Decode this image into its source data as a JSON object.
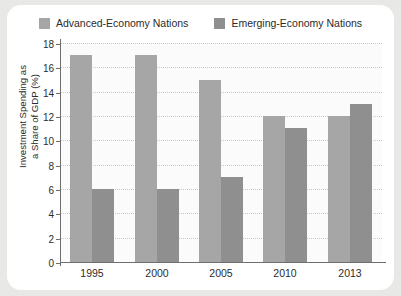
{
  "chart_data": {
    "type": "bar",
    "title": "",
    "xlabel": "",
    "ylabel_line1": "Investment Spending as",
    "ylabel_line2": "a Share of GDP (%)",
    "categories": [
      "1995",
      "2000",
      "2005",
      "2010",
      "2013"
    ],
    "series": [
      {
        "name": "Advanced-Economy Nations",
        "color": "#a6a6a6",
        "values": [
          17,
          17,
          15,
          12,
          12
        ]
      },
      {
        "name": "Emerging-Economy Nations",
        "color": "#8f8f8f",
        "values": [
          6,
          6,
          7,
          11,
          13
        ]
      }
    ],
    "ylim": [
      0,
      18
    ],
    "ytick_step": 2,
    "ytick_labels": [
      "0",
      "2",
      "4",
      "6",
      "8",
      "10",
      "12",
      "14",
      "16",
      "18"
    ],
    "grid": "horizontal-dotted",
    "legend_position": "top-center"
  },
  "legend": {
    "entries": [
      {
        "label": "Advanced-Economy Nations"
      },
      {
        "label": "Emerging-Economy Nations"
      }
    ]
  }
}
